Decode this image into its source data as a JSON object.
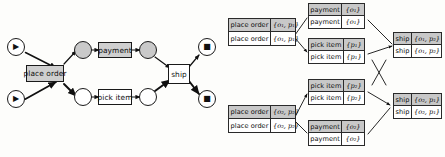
{
  "figure": {
    "background_color": "#fdfdfb",
    "shade_color": "#c8c8c8",
    "line_color": "#1a1a1a"
  },
  "petri_net": {
    "places": [
      {
        "id": "p-src-order",
        "name": "source-place-order",
        "marker": "▶",
        "marker_name": "play-marker",
        "shaded": false
      },
      {
        "id": "p-src-item",
        "name": "source-place-item",
        "marker": "▶",
        "marker_name": "play-marker",
        "shaded": false
      },
      {
        "id": "p-order-mid",
        "name": "place-order-pending",
        "marker": "",
        "marker_name": "none",
        "shaded": true
      },
      {
        "id": "p-item-mid",
        "name": "place-item-pending",
        "marker": "",
        "marker_name": "none",
        "shaded": false
      },
      {
        "id": "p-order-paid",
        "name": "place-order-paid",
        "marker": "",
        "marker_name": "none",
        "shaded": true
      },
      {
        "id": "p-item-pick",
        "name": "place-item-picked",
        "marker": "",
        "marker_name": "none",
        "shaded": false
      },
      {
        "id": "p-sink-order",
        "name": "sink-place-order",
        "marker": "■",
        "marker_name": "stop-marker",
        "shaded": false
      },
      {
        "id": "p-sink-item",
        "name": "sink-place-item",
        "marker": "■",
        "marker_name": "stop-marker",
        "shaded": false
      }
    ],
    "transitions": [
      {
        "id": "t-place-order",
        "label": "place order",
        "shaded": true
      },
      {
        "id": "t-payment",
        "label": "payment",
        "shaded": true
      },
      {
        "id": "t-pick-item",
        "label": "pick item",
        "shaded": false
      },
      {
        "id": "t-ship",
        "label": "ship",
        "shaded": false
      }
    ]
  },
  "alignment": {
    "boxes": [
      {
        "id": "b-po-1",
        "name": "alignment-box-place-order-1",
        "rows": [
          {
            "activity": "place order",
            "objects": "{o₁, p₁}"
          },
          {
            "activity": "place order",
            "objects": "{o₁, p₁}"
          }
        ]
      },
      {
        "id": "b-pay-1",
        "name": "alignment-box-payment-1",
        "rows": [
          {
            "activity": "payment",
            "objects": "{o₁}"
          },
          {
            "activity": "payment",
            "objects": "{o₁}"
          }
        ]
      },
      {
        "id": "b-pick-1",
        "name": "alignment-box-pick-item-1",
        "rows": [
          {
            "activity": "pick item",
            "objects": "{p₁}"
          },
          {
            "activity": "pick item",
            "objects": "{p₁}"
          }
        ]
      },
      {
        "id": "b-ship-1",
        "name": "alignment-box-ship-1",
        "rows": [
          {
            "activity": "ship",
            "objects": "{o₁, p₂}"
          },
          {
            "activity": "ship",
            "objects": "{o₁, p₂}"
          }
        ]
      },
      {
        "id": "b-pick-2",
        "name": "alignment-box-pick-item-2",
        "rows": [
          {
            "activity": "pick item",
            "objects": "{p₂}"
          },
          {
            "activity": "pick item",
            "objects": "{p₂}"
          }
        ]
      },
      {
        "id": "b-po-2",
        "name": "alignment-box-place-order-2",
        "rows": [
          {
            "activity": "place order",
            "objects": "{o₂, p₂}"
          },
          {
            "activity": "place order",
            "objects": "{o₂, p₂}"
          }
        ]
      },
      {
        "id": "b-pay-2",
        "name": "alignment-box-payment-2",
        "rows": [
          {
            "activity": "payment",
            "objects": "{o₂}"
          },
          {
            "activity": "payment",
            "objects": "{o₂}"
          }
        ]
      },
      {
        "id": "b-ship-2",
        "name": "alignment-box-ship-2",
        "rows": [
          {
            "activity": "ship",
            "objects": "{o₂, p₁}"
          },
          {
            "activity": "ship",
            "objects": "{o₂, p₁}"
          }
        ]
      }
    ]
  }
}
